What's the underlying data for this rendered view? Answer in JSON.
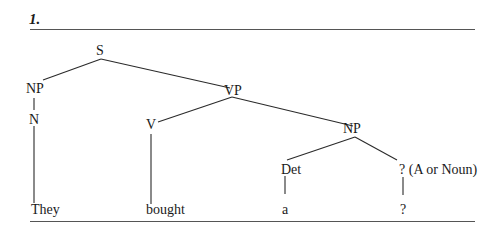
{
  "header": {
    "number": "1."
  },
  "tree": {
    "nodes": {
      "S": "S",
      "NP_subj": "NP",
      "VP": "VP",
      "N": "N",
      "V": "V",
      "NP_obj": "NP",
      "Det": "Det",
      "Unknown": "? (A or Noun)",
      "w_they": "They",
      "w_bought": "bought",
      "w_a": "a",
      "w_q": "?"
    },
    "edges": [
      [
        "S",
        "NP"
      ],
      [
        "S",
        "VP"
      ],
      [
        "NP",
        "N"
      ],
      [
        "N",
        "They"
      ],
      [
        "VP",
        "V"
      ],
      [
        "VP",
        "NP"
      ],
      [
        "V",
        "bought"
      ],
      [
        "NP",
        "Det"
      ],
      [
        "NP",
        "? (A or Noun)"
      ],
      [
        "Det",
        "a"
      ],
      [
        "? (A or Noun)",
        "?"
      ]
    ]
  }
}
